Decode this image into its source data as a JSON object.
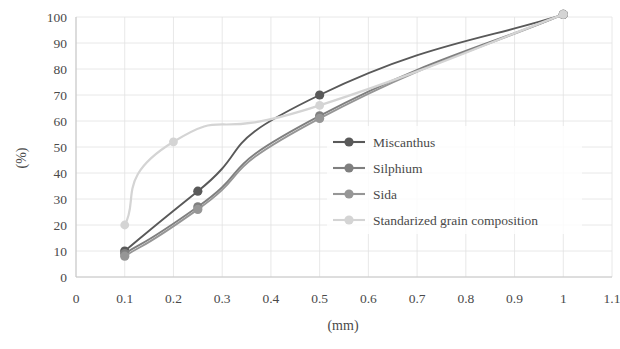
{
  "chart_data": {
    "type": "line",
    "title": "",
    "xlabel": "(mm)",
    "ylabel": "(%)",
    "xlim": [
      0,
      1.1
    ],
    "ylim": [
      0,
      100
    ],
    "xticks": [
      "0",
      "0.1",
      "0.2",
      "0.3",
      "0.4",
      "0.5",
      "0.6",
      "0.7",
      "0.8",
      "0.9",
      "1",
      "1.1"
    ],
    "xtick_values": [
      0,
      0.1,
      0.2,
      0.3,
      0.4,
      0.5,
      0.6,
      0.7,
      0.8,
      0.9,
      1,
      1.1
    ],
    "yticks": [
      "0",
      "10",
      "20",
      "30",
      "40",
      "50",
      "60",
      "70",
      "80",
      "90",
      "100"
    ],
    "ytick_values": [
      0,
      10,
      20,
      30,
      40,
      50,
      60,
      70,
      80,
      90,
      100
    ],
    "grid": true,
    "legend_position": "center-right-inside",
    "series": [
      {
        "name": "Miscanthus",
        "color": "#595959",
        "x": [
          0.1,
          0.25,
          0.5,
          1.0
        ],
        "values": [
          10,
          33,
          70,
          101
        ]
      },
      {
        "name": "Silphium",
        "color": "#7f7f7f",
        "x": [
          0.1,
          0.25,
          0.5,
          1.0
        ],
        "values": [
          9,
          27,
          62,
          101
        ]
      },
      {
        "name": "Sida",
        "color": "#969696",
        "x": [
          0.1,
          0.25,
          0.5,
          1.0
        ],
        "values": [
          8,
          26,
          61,
          101
        ]
      },
      {
        "name": "Standarized grain composition",
        "color": "#d4d4d4",
        "x": [
          0.1,
          0.2,
          0.5,
          1.0
        ],
        "values": [
          20,
          52,
          66,
          101
        ]
      }
    ]
  },
  "legend": {
    "items": [
      {
        "label": "Miscanthus",
        "color": "#595959"
      },
      {
        "label": "Silphium",
        "color": "#7f7f7f"
      },
      {
        "label": "Sida",
        "color": "#969696"
      },
      {
        "label": "Standarized grain composition",
        "color": "#d4d4d4"
      }
    ]
  },
  "axes": {
    "x_title": "(mm)",
    "y_title": "(%)"
  }
}
